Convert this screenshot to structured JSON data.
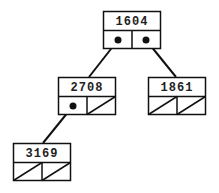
{
  "diagram": {
    "type": "binary-tree",
    "colors": {
      "stroke": "#111111",
      "background": "#ffffff",
      "text": "#222222"
    },
    "nodes": [
      {
        "id": "n1604",
        "value": "1604",
        "x": 103,
        "y": 11,
        "left": "pointer",
        "right": "pointer"
      },
      {
        "id": "n2708",
        "value": "2708",
        "x": 58,
        "y": 77,
        "left": "pointer",
        "right": "null"
      },
      {
        "id": "n1861",
        "value": "1861",
        "x": 148,
        "y": 77,
        "left": "null",
        "right": "null"
      },
      {
        "id": "n3169",
        "value": "3169",
        "x": 13,
        "y": 143,
        "left": "null",
        "right": "null"
      }
    ],
    "edges": [
      {
        "from": "1604",
        "side": "left",
        "to": "2708"
      },
      {
        "from": "1604",
        "side": "right",
        "to": "1861"
      },
      {
        "from": "2708",
        "side": "left",
        "to": "3169"
      }
    ]
  }
}
